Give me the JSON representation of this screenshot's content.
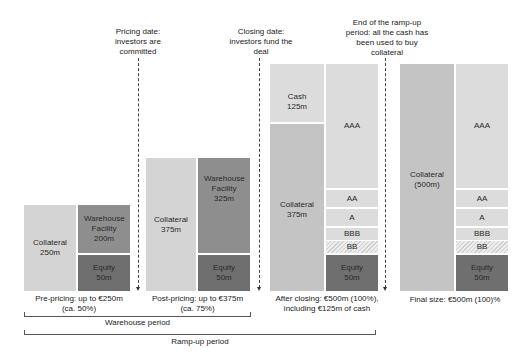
{
  "annotations": {
    "pricing_date": "Pricing date: investors are committed",
    "closing_date": "Closing date: investors fund the deal",
    "end_ramp_up": "End of the ramp-up period: all the cash has been used to buy collateral"
  },
  "stages": [
    {
      "caption_line1": "Pre-pricing: up to €250m",
      "caption_line2": "(ca. 50%)",
      "left": [
        {
          "label": "Collateral",
          "value": "250m"
        }
      ],
      "right": [
        {
          "label": "Warehouse Facility",
          "value": "200m"
        },
        {
          "label": "Equity",
          "value": "50m"
        }
      ]
    },
    {
      "caption_line1": "Post-pricing: up to €375m",
      "caption_line2": "(ca. 75%)",
      "left": [
        {
          "label": "Collateral",
          "value": "375m"
        }
      ],
      "right": [
        {
          "label": "Warehouse Facility",
          "value": "325m"
        },
        {
          "label": "Equity",
          "value": "50m"
        }
      ]
    },
    {
      "caption_line1": "After closing: €500m (100%),",
      "caption_line2": "including €125m of cash",
      "left": [
        {
          "label": "Cash",
          "value": "125m"
        },
        {
          "label": "Collateral",
          "value": "375m"
        }
      ],
      "right": [
        {
          "label": "AAA"
        },
        {
          "label": "AA"
        },
        {
          "label": "A"
        },
        {
          "label": "BBB"
        },
        {
          "label": "BB"
        },
        {
          "label": "Equity",
          "value": "50m"
        }
      ]
    },
    {
      "caption_line1": "Final size: €500m (100)%",
      "left": [
        {
          "label": "Collateral",
          "value": "(500m)"
        }
      ],
      "right": [
        {
          "label": "AAA"
        },
        {
          "label": "AA"
        },
        {
          "label": "A"
        },
        {
          "label": "BBB"
        },
        {
          "label": "BB"
        },
        {
          "label": "Equity",
          "value": "50m"
        }
      ]
    }
  ],
  "periods": {
    "warehouse": "Warehouse period",
    "ramp_up": "Ramp-up period"
  }
}
